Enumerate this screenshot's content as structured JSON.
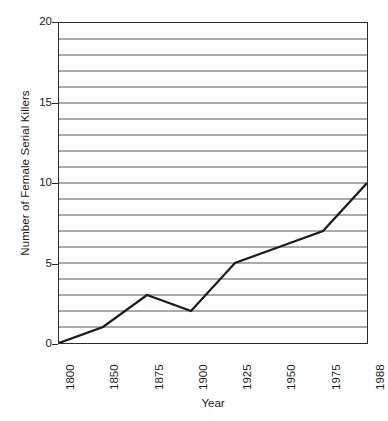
{
  "chart_data": {
    "type": "line",
    "title": "",
    "xlabel": "Year",
    "ylabel": "Number of Female Serial Killers",
    "categories": [
      "1800",
      "1850",
      "1875",
      "1900",
      "1925",
      "1950",
      "1975",
      "1988"
    ],
    "values": [
      0,
      1,
      3,
      2,
      5,
      6,
      7,
      10
    ],
    "series": [
      {
        "name": "Number of Female Serial Killers",
        "values": [
          0,
          1,
          3,
          2,
          5,
          6,
          7,
          10
        ]
      }
    ],
    "ylim": [
      0,
      20
    ],
    "y_ticks": [
      0,
      5,
      10,
      15,
      20
    ],
    "y_tick_labels": [
      "0",
      "5",
      "10",
      "15",
      "20"
    ],
    "y_gridline_interval": 1,
    "grid": "horizontal",
    "legend": "none",
    "line_color": "#1a1a1a",
    "gridline_color": "#555555",
    "axis_color": "#2b2b2b",
    "background_color": "#ffffff",
    "markers": "none"
  },
  "axes": {
    "x_title": "Year",
    "y_title": "Number of Female Serial Killers"
  }
}
